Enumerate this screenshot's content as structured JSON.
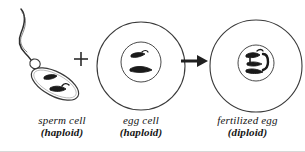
{
  "diagram": {
    "background_color": "#ffffff",
    "ink_color": "#2b2b2b",
    "chromosome_fill": "#1a1a1a"
  },
  "operators": {
    "plus_symbol": "+",
    "arrow_symbol": "→"
  },
  "cells": [
    {
      "id": "sperm",
      "shape": "sperm",
      "chromosome_count": 2,
      "ploidy_n": "n",
      "caption": {
        "name": "sperm cell",
        "ploidy": "(haploid)"
      }
    },
    {
      "id": "egg",
      "shape": "circle",
      "chromosome_count": 2,
      "ploidy_n": "n",
      "caption": {
        "name": "egg cell",
        "ploidy": "(haploid)"
      }
    },
    {
      "id": "fertilized",
      "shape": "circle",
      "chromosome_count": 4,
      "ploidy_n": "2n",
      "caption": {
        "name": "fertilized egg",
        "ploidy": "(diploid)"
      }
    }
  ]
}
